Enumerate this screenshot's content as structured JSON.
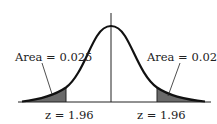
{
  "diagram": {
    "type": "normal-distribution",
    "left_tail": {
      "area_label": "Area = 0.025",
      "z_label": "z = 1.96"
    },
    "right_tail": {
      "area_label": "Area = 0.025",
      "z_label": "z = 1.96"
    },
    "colors": {
      "curve": "#111111",
      "shade": "#666666",
      "axis": "#222222"
    }
  }
}
